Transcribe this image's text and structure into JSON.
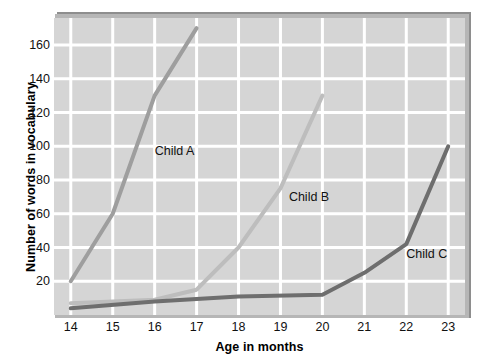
{
  "chart_data": {
    "type": "line",
    "title": "",
    "xlabel": "Age in months",
    "ylabel": "Number of words in vocabulary",
    "xlim": [
      13.6,
      23.4
    ],
    "ylim": [
      0,
      176
    ],
    "grid": true,
    "legend_position": "inline-labels",
    "xticks": [
      14,
      15,
      16,
      17,
      18,
      19,
      20,
      21,
      22,
      23
    ],
    "yticks": [
      20,
      40,
      60,
      80,
      100,
      120,
      140,
      160
    ],
    "xtick_labels": [
      "14",
      "15",
      "16",
      "17",
      "18",
      "19",
      "20",
      "21",
      "22",
      "23"
    ],
    "ytick_labels": [
      "20",
      "40",
      "60",
      "80",
      "100",
      "120",
      "140",
      "160"
    ],
    "series": [
      {
        "name": "Child A",
        "color": "#9e9e9e",
        "label_x": 16.0,
        "label_y": 97,
        "x": [
          14,
          15,
          16,
          17
        ],
        "values": [
          20,
          60,
          130,
          170
        ]
      },
      {
        "name": "Child B",
        "color": "#bdbdbd",
        "label_x": 19.2,
        "label_y": 70,
        "x": [
          14,
          16,
          17,
          18,
          19,
          20
        ],
        "values": [
          7,
          9,
          15,
          40,
          75,
          130
        ]
      },
      {
        "name": "Child C",
        "color": "#6e6e6e",
        "label_x": 22.0,
        "label_y": 36,
        "x": [
          14,
          16,
          18,
          20,
          21,
          22,
          23
        ],
        "values": [
          4,
          8,
          11,
          12,
          25,
          42,
          100
        ]
      }
    ]
  },
  "colors": {
    "plot_background": "#d5d5d5",
    "gridline": "#ffffff",
    "shadow_dark": "#8e8e8e",
    "shadow_light": "#b6b6b6",
    "text": "#111111",
    "page_background": "#ffffff"
  }
}
